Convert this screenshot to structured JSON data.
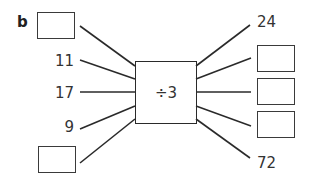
{
  "part_label": "b",
  "machine": {
    "operation": "÷3"
  },
  "inputs": [
    {
      "type": "blank",
      "value": ""
    },
    {
      "type": "number",
      "value": "11"
    },
    {
      "type": "number",
      "value": "17"
    },
    {
      "type": "number",
      "value": "9"
    },
    {
      "type": "blank",
      "value": ""
    }
  ],
  "outputs": [
    {
      "type": "number",
      "value": "24"
    },
    {
      "type": "blank",
      "value": ""
    },
    {
      "type": "blank",
      "value": ""
    },
    {
      "type": "blank",
      "value": ""
    },
    {
      "type": "number",
      "value": "72"
    }
  ],
  "colors": {
    "line": "#2a2a2a",
    "text": "#333333",
    "background": "#ffffff"
  }
}
